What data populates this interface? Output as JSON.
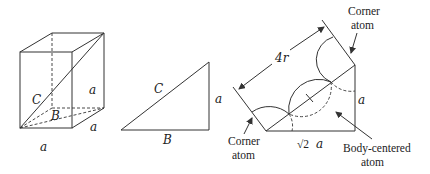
{
  "figure": {
    "panels": [
      {
        "id": "cube",
        "labels": {
          "edge_vertical": "a",
          "body_diagonal": "C",
          "face_diagonal": "B",
          "edge_front": "a",
          "edge_depth": "a"
        }
      },
      {
        "id": "right-triangle",
        "labels": {
          "hypotenuse": "C",
          "vertical_leg": "a",
          "base": "B"
        }
      },
      {
        "id": "bcc-diagonal-section",
        "labels": {
          "length": "4r",
          "height": "a",
          "base_sqrt": "√2",
          "base_a": "a",
          "corner_atom_top_line1": "Corner",
          "corner_atom_top_line2": "atom",
          "corner_atom_bottom_line1": "Corner",
          "corner_atom_bottom_line2": "atom",
          "body_centered_line1": "Body-centered",
          "body_centered_line2": "atom"
        }
      }
    ]
  }
}
